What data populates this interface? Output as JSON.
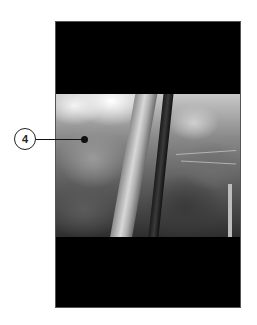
{
  "figure": {
    "callout": {
      "number": "4"
    },
    "colors": {
      "screen": "#000000",
      "background": "#ffffff",
      "callout_stroke": "#222222"
    }
  }
}
